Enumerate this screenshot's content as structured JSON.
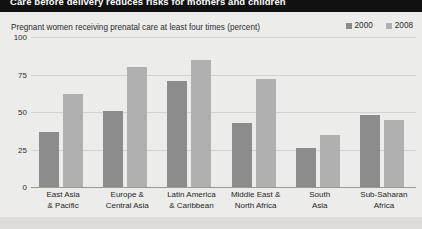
{
  "header": {
    "title": "Care before delivery reduces risks for mothers and children"
  },
  "chart": {
    "subtitle": "Pregnant women receiving prenatal care at least four times (percent)",
    "legend": [
      {
        "label": "2000",
        "color": "#8c8c8c"
      },
      {
        "label": "2008",
        "color": "#b0b0b0"
      }
    ]
  },
  "chart_data": {
    "type": "bar",
    "title": "Care before delivery reduces risks for mothers and children",
    "subtitle": "Pregnant women receiving prenatal care at least four times (percent)",
    "xlabel": "",
    "ylabel": "",
    "ylim": [
      0,
      100
    ],
    "yticks": [
      0,
      25,
      50,
      75,
      100
    ],
    "ytick_labels": [
      "0",
      "25",
      "50",
      "75",
      "100"
    ],
    "grid": true,
    "legend_position": "top-right",
    "categories": [
      "East Asia\n& Pacific",
      "Europe &\nCentral Asia",
      "Latin America\n& Caribbean",
      "Middle East &\nNorth Africa",
      "South\nAsia",
      "Sub-Saharan\nAfrica"
    ],
    "series": [
      {
        "name": "2000",
        "color": "#8c8c8c",
        "values": [
          37,
          51,
          71,
          43,
          26,
          48
        ]
      },
      {
        "name": "2008",
        "color": "#b0b0b0",
        "values": [
          62,
          80,
          85,
          72,
          35,
          45
        ]
      }
    ]
  }
}
